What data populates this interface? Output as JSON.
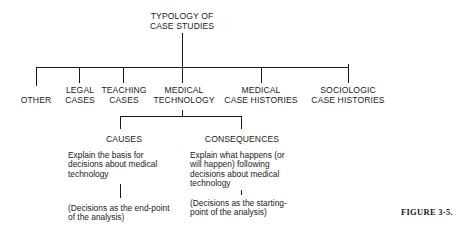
{
  "root": {
    "label_line1": "TYPOLOGY OF",
    "label_line2": "CASE STUDIES"
  },
  "categories": [
    {
      "id": "other",
      "line1": "",
      "line2": "OTHER"
    },
    {
      "id": "legal",
      "line1": "LEGAL",
      "line2": "CASES"
    },
    {
      "id": "teaching",
      "line1": "TEACHING",
      "line2": "CASES"
    },
    {
      "id": "medical-technology",
      "line1": "MEDICAL",
      "line2": "TECHNOLOGY"
    },
    {
      "id": "medical-case-histories",
      "line1": "MEDICAL",
      "line2": "CASE HISTORIES"
    },
    {
      "id": "sociologic-case-histories",
      "line1": "SOCIOLOGIC",
      "line2": "CASE HISTORIES"
    }
  ],
  "subcategories": [
    {
      "id": "causes",
      "label": "CAUSES",
      "description": [
        "Explain the basis for",
        "decisions about medical",
        "technology"
      ],
      "note": [
        "(Decisions as the end-point",
        "of the analysis)"
      ]
    },
    {
      "id": "consequences",
      "label": "CONSEQUENCES",
      "description": [
        "Explain what happens (or",
        "will happen) following",
        "decisions about medical",
        "technology"
      ],
      "note": [
        "(Decisions as the starting-",
        "point of the analysis)"
      ]
    }
  ],
  "caption": "FIGURE 3-5."
}
